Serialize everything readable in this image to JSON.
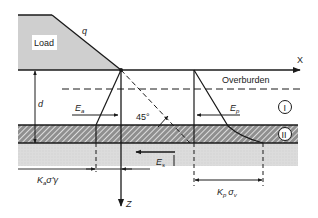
{
  "diagram": {
    "type": "geotechnical-earth-pressure-schematic",
    "labels": {
      "load": "Load",
      "surcharge": "q",
      "x_axis": "X",
      "z_axis": "Z",
      "overburden": "Overburden",
      "depth": "d",
      "angle": "45°",
      "active_force": "E",
      "active_force_sub": "a",
      "passive_force": "E",
      "passive_force_sub": "p",
      "shear_force": "E",
      "shear_force_sub": "s",
      "layer_one": "I",
      "layer_two": "II",
      "active_dim_k": "K",
      "active_dim_k_sub": "a",
      "active_dim_rest": "σ'γ",
      "passive_dim_k": "K",
      "passive_dim_k_sub": "p",
      "passive_dim_sigma": "σ",
      "passive_dim_sigma_sub": "v"
    },
    "colors": {
      "load_fill": "#cfcfcf",
      "lower_layer_fill": "#d9d9d9",
      "line": "#1a1a1a",
      "hatch_bg": "#9a9a9a"
    }
  }
}
